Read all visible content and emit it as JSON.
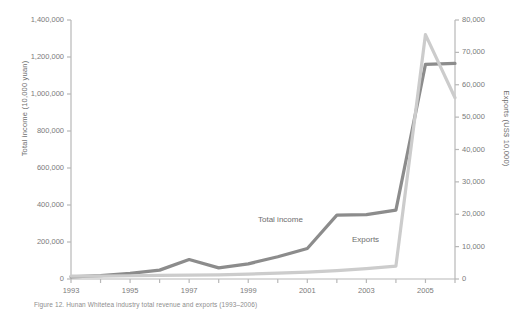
{
  "chart_data": {
    "type": "line",
    "title": "",
    "xlabel": "",
    "x": [
      1993,
      1994,
      1995,
      1996,
      1997,
      1998,
      1999,
      2000,
      2001,
      2002,
      2003,
      2004,
      2005,
      2006
    ],
    "xtick_labels": [
      "1993",
      "1995",
      "1997",
      "1999",
      "2001",
      "2003",
      "2005"
    ],
    "xtick_values": [
      1993,
      1995,
      1997,
      1999,
      2001,
      2003,
      2005
    ],
    "xlim": [
      1993,
      2006
    ],
    "grid": false,
    "legend_position": "inline-annotations",
    "axes": [
      {
        "id": "left",
        "label": "Total income (10,000 yuan)",
        "lim": [
          0,
          1400000
        ],
        "ticks": [
          0,
          200000,
          400000,
          600000,
          800000,
          1000000,
          1200000,
          1400000
        ],
        "tick_labels": [
          "0",
          "200,000",
          "400,000",
          "600,000",
          "800,000",
          "1,000,000",
          "1,200,000",
          "1,400,000"
        ]
      },
      {
        "id": "right",
        "label": "Exports (US$ 10,000)",
        "lim": [
          0,
          80000
        ],
        "ticks": [
          0,
          10000,
          20000,
          30000,
          40000,
          50000,
          60000,
          70000,
          80000
        ],
        "tick_labels": [
          "0",
          "10,000",
          "20,000",
          "30,000",
          "40,000",
          "50,000",
          "60,000",
          "70,000",
          "80,000"
        ]
      }
    ],
    "series": [
      {
        "name": "Total income",
        "axis": "left",
        "color": "#8c8c8c",
        "annotation": "Total income",
        "values": [
          12000,
          18000,
          30000,
          48000,
          105000,
          60000,
          82000,
          120000,
          165000,
          345000,
          348000,
          372000,
          1160000,
          1165000
        ]
      },
      {
        "name": "Exports",
        "axis": "right",
        "color": "#cccccc",
        "annotation": "Exports",
        "values": [
          900,
          900,
          1000,
          1100,
          1200,
          1300,
          1500,
          1800,
          2100,
          2600,
          3200,
          4000,
          75500,
          56000
        ]
      }
    ]
  },
  "annotations": {
    "total_income": "Total income",
    "exports": "Exports"
  },
  "caption": "Figure 12. Hunan Whitetea industry total revenue and exports (1993–2006)"
}
